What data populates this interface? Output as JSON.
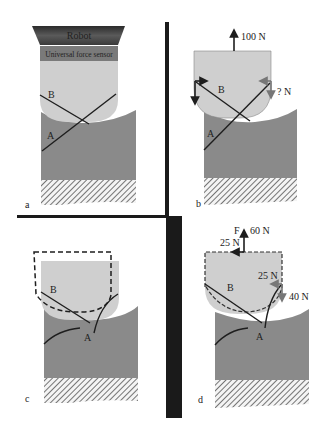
{
  "figure": {
    "panels": [
      {
        "id": "a",
        "panel_label": "a",
        "robot_label": "Robot",
        "sensor_label": "Universal force sensor",
        "region_labels": {
          "upper": "B",
          "lower": "A"
        }
      },
      {
        "id": "b",
        "panel_label": "b",
        "region_labels": {
          "upper": "B",
          "lower": "A"
        },
        "forces": {
          "top": "100 N",
          "right": "? N"
        }
      },
      {
        "id": "c",
        "panel_label": "c",
        "region_labels": {
          "upper": "B",
          "lower": "A"
        }
      },
      {
        "id": "d",
        "panel_label": "d",
        "region_labels": {
          "upper": "B",
          "lower": "A"
        },
        "forces": {
          "symbol": "F",
          "top_vertical": "60 N",
          "top_horizontal": "25 N",
          "right_horizontal": "25 N",
          "right_vertical": "40 N"
        }
      }
    ],
    "colors": {
      "tool_fill": "#cfcfcf",
      "workpiece_fill": "#8a8a8a",
      "robot_dark": "#3a3a3a",
      "sensor_fill": "#7a7a7a",
      "divider": "#1a1a1a",
      "line": "#1e1e1e"
    }
  }
}
